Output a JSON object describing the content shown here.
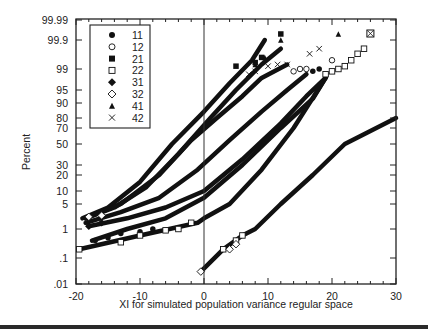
{
  "chart_data": {
    "type": "line",
    "title": "",
    "xlabel": "XI for simulated population variance regular space",
    "ylabel": "Percent",
    "xlim": [
      -20,
      30
    ],
    "x_ticks": [
      -20,
      -10,
      0,
      10,
      20,
      30
    ],
    "x_tick_labels": [
      "-20",
      "-10",
      "0",
      "10",
      "20",
      "30"
    ],
    "y_scale": "normal-probability",
    "y_ticks": [
      0.01,
      0.1,
      1,
      5,
      10,
      20,
      30,
      50,
      70,
      80,
      90,
      95,
      99,
      99.9,
      99.99
    ],
    "y_tick_labels": [
      ".01",
      ".1",
      "1",
      "5",
      "10",
      "20",
      "30",
      "50",
      "70",
      "80",
      "90",
      "95",
      "99",
      "99.9",
      "99.99"
    ],
    "grid": false,
    "reference_line_x": 0,
    "legend_position": "upper-left",
    "legend": [
      {
        "label": "11",
        "marker": "filled-circle"
      },
      {
        "label": "12",
        "marker": "open-circle"
      },
      {
        "label": "21",
        "marker": "filled-square"
      },
      {
        "label": "22",
        "marker": "open-square"
      },
      {
        "label": "31",
        "marker": "filled-diamond"
      },
      {
        "label": "32",
        "marker": "open-diamond"
      },
      {
        "label": "41",
        "marker": "filled-triangle"
      },
      {
        "label": "42",
        "marker": "cross"
      }
    ],
    "series": [
      {
        "name": "21",
        "x": [
          -19,
          -15,
          -10,
          -5,
          0,
          4,
          7.5,
          9.5
        ],
        "y": [
          2,
          4,
          15,
          50,
          85,
          97,
          99.5,
          99.9
        ]
      },
      {
        "name": "41",
        "x": [
          -18.5,
          -14,
          -9,
          -4,
          1,
          5,
          9,
          12
        ],
        "y": [
          2,
          4,
          12,
          40,
          80,
          95,
          99.3,
          99.8
        ]
      },
      {
        "name": "42",
        "x": [
          -18.5,
          -13,
          -7,
          -2,
          2,
          6,
          9,
          13
        ],
        "y": [
          2,
          5,
          20,
          55,
          80,
          93,
          98,
          99.3
        ]
      },
      {
        "name": "12",
        "x": [
          -18.5,
          -13,
          -7,
          -1,
          4,
          9,
          13,
          16
        ],
        "y": [
          1.5,
          3,
          7,
          25,
          55,
          85,
          95,
          98.5
        ]
      },
      {
        "name": "11",
        "x": [
          -17.5,
          -12,
          -6,
          0,
          6,
          12,
          17,
          19
        ],
        "y": [
          0.4,
          1,
          2,
          7,
          30,
          70,
          92,
          98
        ]
      },
      {
        "name": "31",
        "x": [
          -18,
          -12,
          -6,
          0,
          6,
          12,
          16,
          19
        ],
        "y": [
          1.2,
          2,
          4,
          10,
          35,
          75,
          93,
          98
        ]
      },
      {
        "name": "22",
        "x": [
          -19.5,
          -10,
          -1,
          0,
          4,
          9,
          14,
          19
        ],
        "y": [
          0.2,
          0.6,
          1.5,
          2,
          5,
          25,
          70,
          98
        ]
      },
      {
        "name": "32",
        "x": [
          -0.5,
          3,
          6,
          8,
          12,
          17,
          22,
          30
        ],
        "y": [
          0.03,
          0.2,
          0.6,
          1,
          5,
          20,
          50,
          80
        ]
      }
    ]
  },
  "layout": {
    "plot_left_px": 76,
    "plot_right_px": 396,
    "plot_top_px": 19,
    "plot_bottom_px": 284,
    "y_tick_px": [
      284,
      258,
      229,
      204,
      191,
      175,
      165,
      144,
      128,
      118,
      103,
      90,
      69,
      40,
      20
    ]
  }
}
